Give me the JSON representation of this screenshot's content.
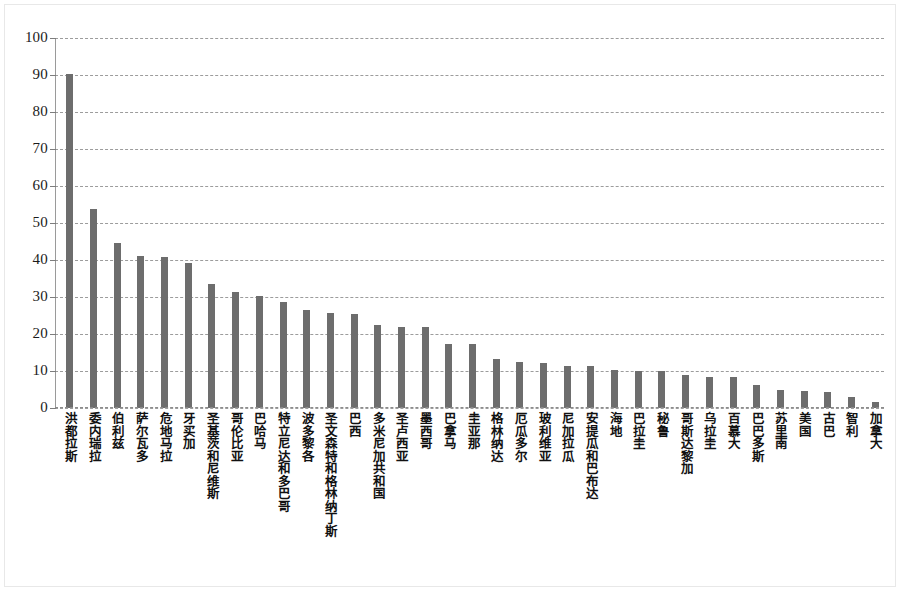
{
  "chart_data": {
    "type": "bar",
    "title": "",
    "subtitle": "",
    "xlabel": "",
    "ylabel": "",
    "ylim": [
      0,
      100
    ],
    "yticks": [
      0,
      10,
      20,
      30,
      40,
      50,
      60,
      70,
      80,
      90,
      100
    ],
    "grid": true,
    "legend": false,
    "legend_position": "none",
    "bar_color": "#6d6d6d",
    "categories": [
      "洪都拉斯",
      "委内瑞拉",
      "伯利兹",
      "萨尔瓦多",
      "危地马拉",
      "牙买加",
      "圣基茨和尼维斯",
      "哥伦比亚",
      "巴哈马",
      "特立尼达和多巴哥",
      "波多黎各",
      "圣文森特和格林纳丁斯",
      "巴西",
      "多米尼加共和国",
      "圣卢西亚",
      "墨西哥",
      "巴拿马",
      "圭亚那",
      "格林纳达",
      "厄瓜多尔",
      "玻利维亚",
      "尼加拉瓜",
      "安提瓜和巴布达",
      "海地",
      "巴拉圭",
      "秘鲁",
      "哥斯达黎加",
      "乌拉圭",
      "百慕大",
      "巴巴多斯",
      "苏里南",
      "美国",
      "古巴",
      "智利",
      "加拿大"
    ],
    "values": [
      90.4,
      53.7,
      44.7,
      41.2,
      40.9,
      39.3,
      33.6,
      31.4,
      30.3,
      28.6,
      26.5,
      25.8,
      25.4,
      22.4,
      21.9,
      21.9,
      17.3,
      17.2,
      13.3,
      12.4,
      12.2,
      11.3,
      11.3,
      10.3,
      10.1,
      10.0,
      8.8,
      8.5,
      8.3,
      6.3,
      4.9,
      4.7,
      4.2,
      3.1,
      1.6
    ]
  },
  "ytick_labels": [
    "100",
    "90",
    "80",
    "70",
    "60",
    "50",
    "40",
    "30",
    "20",
    "10",
    "0"
  ]
}
